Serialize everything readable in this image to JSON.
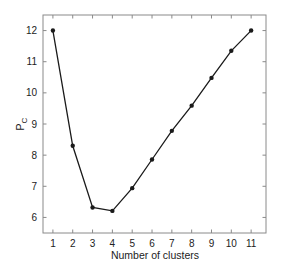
{
  "chart_data": {
    "type": "line",
    "title": "",
    "xlabel": "Number of clusters",
    "ylabel": "P",
    "ylabel_subscript": "C",
    "x": [
      1,
      2,
      3,
      4,
      5,
      6,
      7,
      8,
      9,
      10,
      11
    ],
    "series": [
      {
        "name": "P_C",
        "values": [
          12.0,
          8.3,
          6.32,
          6.21,
          6.94,
          7.86,
          8.78,
          9.59,
          10.48,
          11.35,
          12.0
        ],
        "color": "#1a1a1a",
        "marker": "circle"
      }
    ],
    "xticks": [
      1,
      2,
      3,
      4,
      5,
      6,
      7,
      8,
      9,
      10,
      11
    ],
    "yticks": [
      6,
      7,
      8,
      9,
      10,
      11,
      12
    ],
    "xlim": [
      0.5,
      11.75
    ],
    "ylim": [
      5.5,
      12.5
    ],
    "grid": false,
    "legend": null
  }
}
